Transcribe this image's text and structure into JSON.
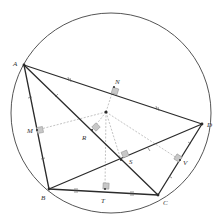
{
  "diagram": {
    "colors": {
      "stroke": "#2b2b2b",
      "circle": "#555555",
      "dashed": "#9a9a9a",
      "marker_fill": "#c8c8c8",
      "marker_stroke": "#8a8a8a",
      "label": "#333333"
    },
    "circle": {
      "cx": 111,
      "cy": 113,
      "r": 100
    },
    "center": {
      "x": 106,
      "y": 112
    },
    "vertices": [
      {
        "name": "A",
        "x": 24,
        "y": 65,
        "lx": 13,
        "ly": 64
      },
      {
        "name": "B",
        "x": 49,
        "y": 189,
        "lx": 41,
        "ly": 199
      },
      {
        "name": "C",
        "x": 158,
        "y": 195,
        "lx": 163,
        "ly": 204
      },
      {
        "name": "D",
        "x": 202,
        "y": 124,
        "lx": 207,
        "ly": 126
      }
    ],
    "feet": [
      {
        "name": "N",
        "x": 114,
        "y": 87,
        "lx": 116,
        "ly": 84
      },
      {
        "name": "M",
        "x": 37,
        "y": 130,
        "lx": 28,
        "ly": 132
      },
      {
        "name": "R",
        "x": 92,
        "y": 130,
        "lx": 82,
        "ly": 139
      },
      {
        "name": "S",
        "x": 121,
        "y": 160,
        "lx": 129,
        "ly": 163
      },
      {
        "name": "T",
        "x": 105,
        "y": 189,
        "lx": 101,
        "ly": 202
      },
      {
        "name": "V",
        "x": 180,
        "y": 160,
        "lx": 184,
        "ly": 164
      }
    ],
    "labels": {
      "A": "A",
      "B": "B",
      "C": "C",
      "D": "D",
      "N": "N",
      "M": "M",
      "R": "R",
      "S": "S",
      "T": "T",
      "V": "V"
    }
  }
}
